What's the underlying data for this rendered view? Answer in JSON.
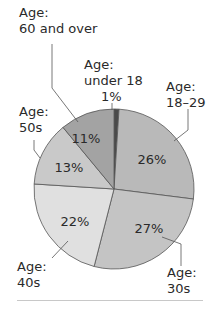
{
  "chart_data": {
    "type": "pie",
    "title": "",
    "categories": [
      "Age: under 18",
      "Age: 18–29",
      "Age: 30s",
      "Age: 40s",
      "Age: 50s",
      "Age: 60 and over"
    ],
    "values": [
      1,
      26,
      27,
      22,
      13,
      11
    ],
    "value_labels": [
      "1%",
      "26%",
      "27%",
      "22%",
      "13%",
      "11%"
    ],
    "colors": [
      "#4a4a4a",
      "#b9b9b9",
      "#c4c4c4",
      "#e0e0e0",
      "#c9c9c9",
      "#a3a3a3"
    ],
    "start_angle_deg": 0,
    "direction": "clockwise",
    "legend": "none (callout labels)",
    "grid": false
  },
  "labels": {
    "under18": {
      "line1": "Age:",
      "line2": "under 18",
      "pct": "1%"
    },
    "a18_29": {
      "line1": "Age:",
      "line2": "18–29",
      "pct": "26%"
    },
    "a30s": {
      "line1": "Age:",
      "line2": "30s",
      "pct": "27%"
    },
    "a40s": {
      "line1": "Age:",
      "line2": "40s",
      "pct": "22%"
    },
    "a50s": {
      "line1": "Age:",
      "line2": "50s",
      "pct": "13%"
    },
    "a60": {
      "line1": "Age:",
      "line2": "60 and over",
      "pct": "11%"
    }
  }
}
